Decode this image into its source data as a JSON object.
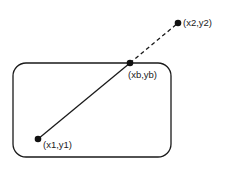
{
  "diagram": {
    "points": {
      "p1": {
        "label": "(x1,y1)"
      },
      "pb": {
        "label": "(xb,yb)"
      },
      "p2": {
        "label": "(x2,y2)"
      }
    },
    "colors": {
      "stroke": "#1a1a1a",
      "background": "#ffffff"
    }
  }
}
